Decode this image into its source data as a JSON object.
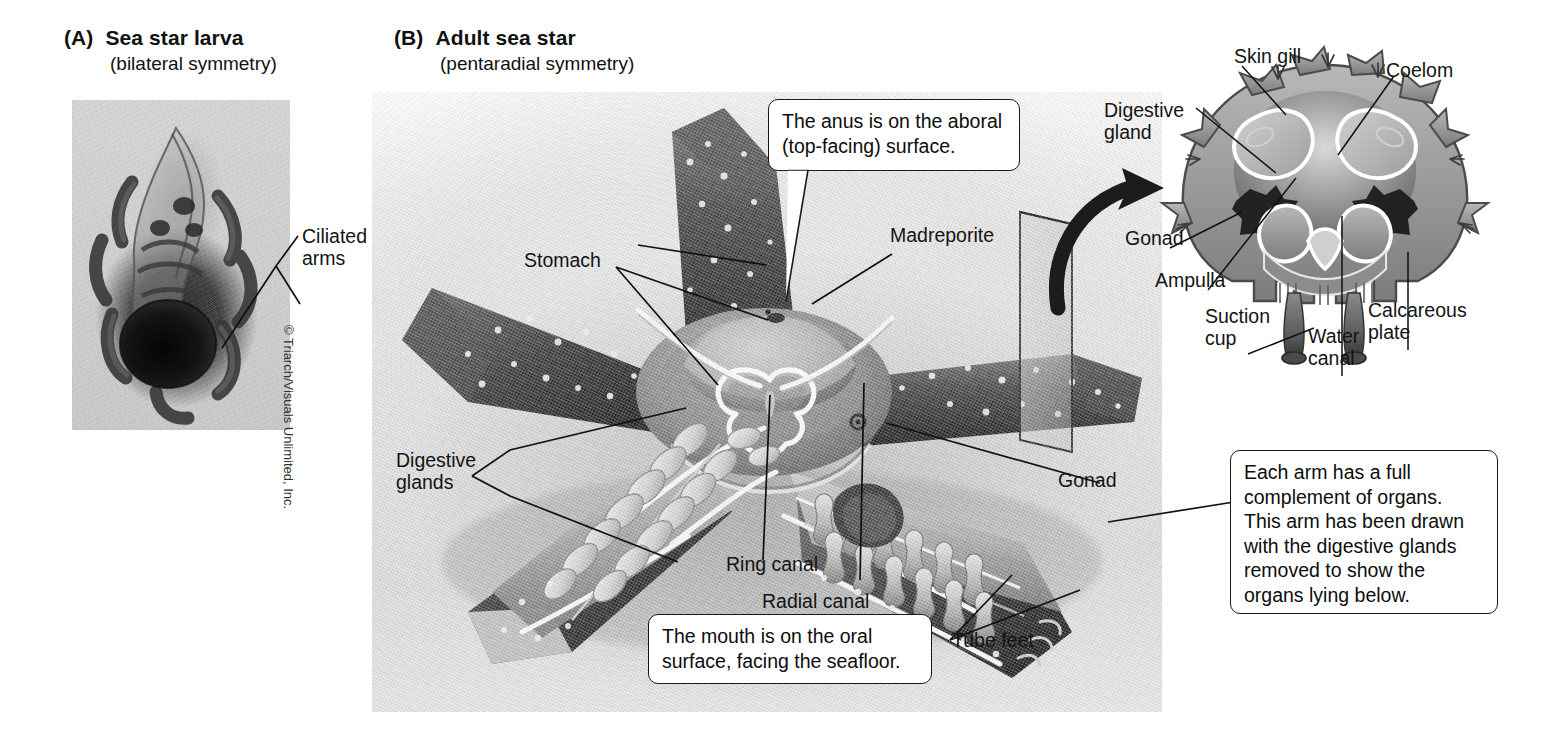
{
  "figure": {
    "background_color": "#ffffff",
    "ink_color": "#111111"
  },
  "panel_a": {
    "letter": "(A)",
    "title": "Sea star larva",
    "subtitle": "(bilateral symmetry)",
    "photo_caption_credit": "© Triarch/Visuals Unlimited, Inc.",
    "labels": [
      {
        "id": "ciliated-arms",
        "line1": "Ciliated",
        "line2": "arms"
      }
    ]
  },
  "panel_b": {
    "letter": "(B)",
    "title": "Adult sea star",
    "subtitle": "(pentaradial symmetry)",
    "labels": [
      {
        "id": "stomach",
        "text": "Stomach"
      },
      {
        "id": "madreporite",
        "text": "Madreporite"
      },
      {
        "id": "digestive-glands",
        "line1": "Digestive",
        "line2": "glands"
      },
      {
        "id": "ring-canal",
        "text": "Ring canal"
      },
      {
        "id": "radial-canal",
        "text": "Radial canal"
      },
      {
        "id": "tube-feet",
        "text": "Tube feet"
      },
      {
        "id": "gonad",
        "text": "Gonad"
      }
    ],
    "callouts": [
      {
        "id": "anus-callout",
        "line1": "The anus is on the aboral",
        "line2": "(top-facing) surface."
      },
      {
        "id": "mouth-callout",
        "line1": "The mouth is on the oral",
        "line2": "surface, facing the seafloor."
      },
      {
        "id": "arm-callout",
        "line1": "Each arm has a full",
        "line2": "complement of organs.",
        "line3": "This arm has been drawn",
        "line4": "with the digestive glands",
        "line5": "removed to show the",
        "line6": "organs lying below."
      }
    ]
  },
  "inset": {
    "title_implicit": "Arm cross section",
    "labels": [
      {
        "id": "skin-gill",
        "text": "Skin gill"
      },
      {
        "id": "coelom",
        "text": "Coelom"
      },
      {
        "id": "digestive-gland",
        "line1": "Digestive",
        "line2": "gland"
      },
      {
        "id": "gonad",
        "text": "Gonad"
      },
      {
        "id": "ampulla",
        "text": "Ampulla"
      },
      {
        "id": "suction-cup",
        "line1": "Suction",
        "line2": "cup"
      },
      {
        "id": "water-canal",
        "line1": "Water",
        "line2": "canal"
      },
      {
        "id": "calcareous-plate",
        "line1": "Calcareous",
        "line2": "plate"
      }
    ]
  }
}
